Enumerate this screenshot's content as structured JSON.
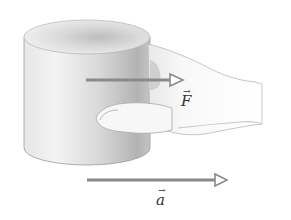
{
  "diagram": {
    "objects": [
      {
        "name": "cylinder",
        "shape": "cylinder"
      },
      {
        "name": "hand",
        "shape": "hand"
      }
    ],
    "vectors": [
      {
        "id": "force",
        "symbol": "F",
        "arrow_glyph": "→",
        "direction": "right"
      },
      {
        "id": "acceleration",
        "symbol": "a",
        "arrow_glyph": "→",
        "direction": "right"
      }
    ],
    "colors": {
      "arrow": "#8a8a8a",
      "cylinder_light": "#f2f2f2",
      "cylinder_dark": "#a9a9a9",
      "hand_fill": "#fafafa",
      "hand_outline": "#b0b0b0",
      "label": "#333333"
    }
  }
}
